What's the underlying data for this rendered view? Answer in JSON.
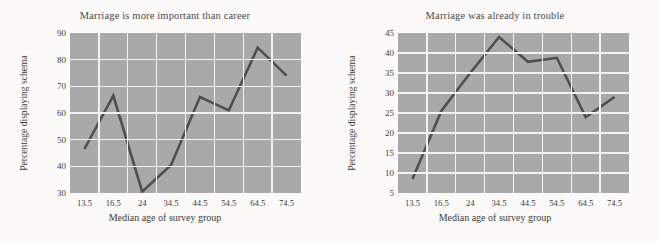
{
  "figure": {
    "background_color": "#fbfaf8",
    "plot_background_color": "#a9a9a9",
    "gridline_color": "#f2f2f2",
    "series_color": "#4f4f4f"
  },
  "chart_data": [
    {
      "type": "line",
      "title": "Marriage is more important than career",
      "xlabel": "Median age of survey group",
      "ylabel": "Percentage displaying schema",
      "categories": [
        "13.5",
        "16.5",
        "24",
        "34.5",
        "44.5",
        "54.5",
        "64.5",
        "74.5"
      ],
      "values": [
        46.5,
        66.5,
        30.5,
        40.5,
        66,
        61,
        84.5,
        74
      ],
      "ylim": [
        30,
        90
      ],
      "yticks": [
        "90",
        "80",
        "70",
        "60",
        "50",
        "40",
        "30"
      ],
      "ytick_values": [
        90,
        80,
        70,
        60,
        50,
        40,
        30
      ],
      "xticks": [
        "13.5",
        "16.5",
        "24",
        "34.5",
        "44.5",
        "54.5",
        "64.5",
        "74.5"
      ],
      "grid": true,
      "legend": "none"
    },
    {
      "type": "line",
      "title": "Marriage was already in trouble",
      "xlabel": "Median age of survey group",
      "ylabel": "Percentage displaying schema",
      "categories": [
        "13.5",
        "16.5",
        "24",
        "34.5",
        "44.5",
        "54.5",
        "64.5",
        "74.5"
      ],
      "values": [
        8.5,
        25.5,
        35,
        44,
        37.8,
        38.8,
        24,
        29
      ],
      "ylim": [
        5,
        45
      ],
      "yticks": [
        "45",
        "40",
        "35",
        "30",
        "25",
        "20",
        "15",
        "10",
        "5"
      ],
      "ytick_values": [
        45,
        40,
        35,
        30,
        25,
        20,
        15,
        10,
        5
      ],
      "xticks": [
        "13.5",
        "16.5",
        "24",
        "34.5",
        "44.5",
        "54.5",
        "64.5",
        "74.5"
      ],
      "grid": true,
      "legend": "none"
    }
  ]
}
